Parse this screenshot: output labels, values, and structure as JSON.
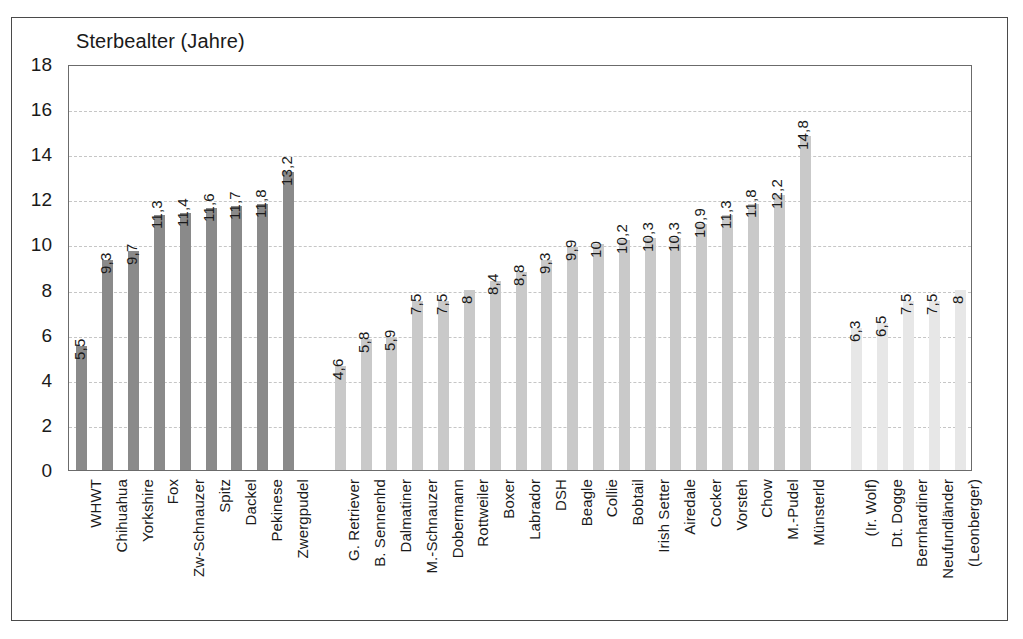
{
  "chart_data": {
    "type": "bar",
    "title": "Sterbealter (Jahre)",
    "xlabel": "",
    "ylabel": "",
    "ylim": [
      0,
      18
    ],
    "ytick_step": 2,
    "yticks": [
      "0",
      "2",
      "4",
      "6",
      "8",
      "10",
      "12",
      "14",
      "16",
      "18"
    ],
    "grid": true,
    "grid_axis": "y",
    "legend": "none",
    "decimal_separator": ",",
    "categories": [
      "WHWT",
      "Chihuahua",
      "Yorkshire",
      "Fox",
      "Zw-Schnauzer",
      "Spitz",
      "Dackel",
      "Pekinese",
      "Zwergpudel",
      "G. Retriever",
      "B. Sennenhd",
      "Dalmatiner",
      "M.-Schnauzer",
      "Dobermann",
      "Rottweiler",
      "Boxer",
      "Labrador",
      "DSH",
      "Beagle",
      "Collie",
      "Bobtail",
      "Irish Setter",
      "Airedale",
      "Cocker",
      "Vorsteh",
      "Chow",
      "M.-Pudel",
      "Münsterld",
      "(Ir. Wolf)",
      "Dt. Dogge",
      "Bernhardiner",
      "Neufundländer",
      "(Leonberger)"
    ],
    "values": [
      5.5,
      9.3,
      9.7,
      11.3,
      11.4,
      11.6,
      11.7,
      11.8,
      13.2,
      4.6,
      5.8,
      5.9,
      7.5,
      7.5,
      8,
      8.4,
      8.8,
      9.3,
      9.9,
      10,
      10.2,
      10.3,
      10.3,
      10.9,
      11.3,
      11.8,
      12.2,
      14.8,
      6.3,
      6.5,
      7.5,
      7.5,
      8
    ],
    "value_labels": [
      "5,5",
      "9,3",
      "9,7",
      "11,3",
      "11,4",
      "11,6",
      "11,7",
      "11,8",
      "13,2",
      "4,6",
      "5,8",
      "5,9",
      "7,5",
      "7,5",
      "8",
      "8,4",
      "8,8",
      "9,3",
      "9,9",
      "10",
      "10,2",
      "10,3",
      "10,3",
      "10,9",
      "11,3",
      "11,8",
      "12,2",
      "14,8",
      "6,3",
      "6,5",
      "7,5",
      "7,5",
      "8"
    ],
    "slots": [
      0,
      1,
      2,
      3,
      4,
      5,
      6,
      7,
      8,
      10,
      11,
      12,
      13,
      14,
      15,
      16,
      17,
      18,
      19,
      20,
      21,
      22,
      23,
      24,
      25,
      26,
      27,
      28,
      30,
      31,
      32,
      33,
      34
    ],
    "total_slots": 35,
    "groups": [
      {
        "name": "small-breeds",
        "color": "#8a8a8a",
        "start_index": 0,
        "end_index": 8
      },
      {
        "name": "medium-breeds",
        "color": "#c9c9c9",
        "start_index": 9,
        "end_index": 27
      },
      {
        "name": "giant-breeds",
        "color": "#e7e7e7",
        "start_index": 28,
        "end_index": 32
      }
    ],
    "colors": {
      "group_small": "#8a8a8a",
      "group_medium": "#c9c9c9",
      "group_giant": "#e7e7e7",
      "gridline": "#c6c6c6",
      "axis": "#6b6b6b",
      "frame": "#4a4a4a",
      "text": "#1a1a1a",
      "background": "#ffffff"
    }
  }
}
